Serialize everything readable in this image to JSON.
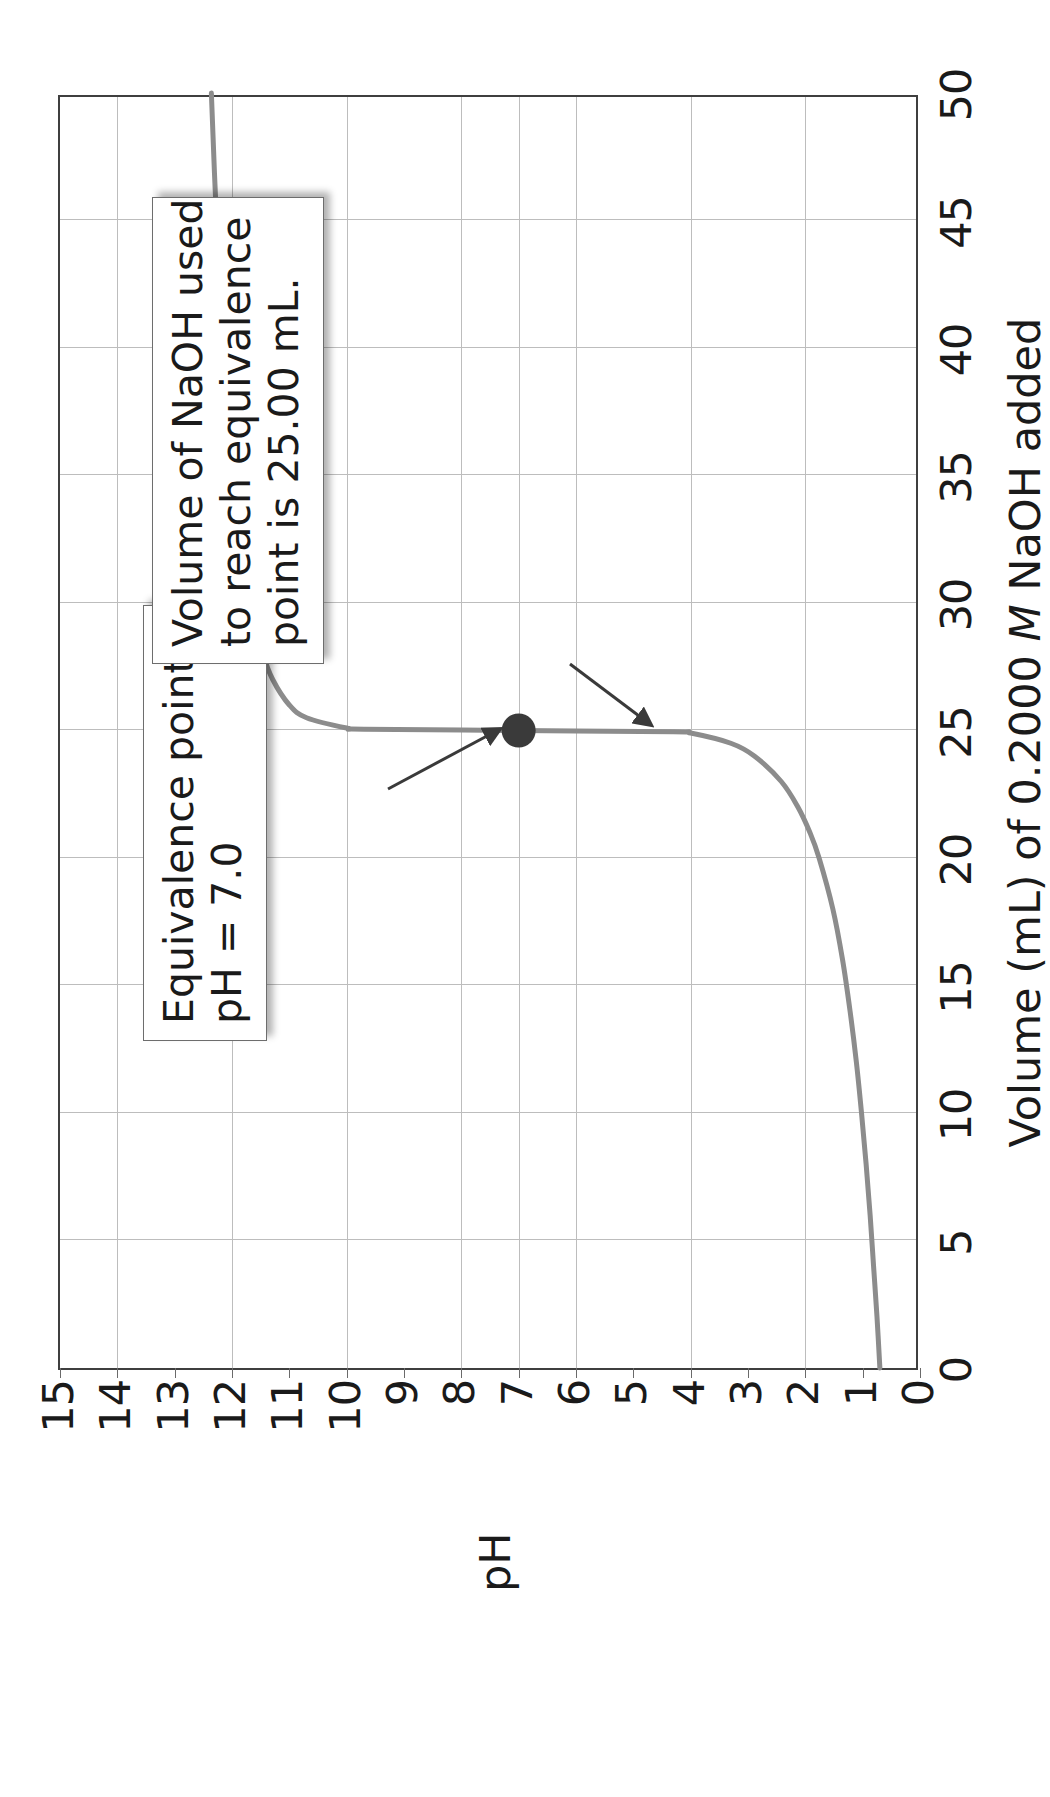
{
  "chart_data": {
    "type": "line",
    "title": "",
    "xlabel": "Volume (mL) of 0.2000 M NaOH added",
    "xlabel_parts": {
      "before": "Volume (mL) of 0.2000 ",
      "italic": "M",
      "after": " NaOH added"
    },
    "ylabel": "pH",
    "xlim": [
      0,
      50
    ],
    "ylim": [
      0,
      15
    ],
    "xticks": [
      "0",
      "5",
      "10",
      "15",
      "20",
      "25",
      "30",
      "35",
      "40",
      "45",
      "50"
    ],
    "xtick_values": [
      0,
      5,
      10,
      15,
      20,
      25,
      30,
      35,
      40,
      45,
      50
    ],
    "yticks": [
      "0",
      "1",
      "2",
      "3",
      "4",
      "5",
      "6",
      "7",
      "8",
      "9",
      "10",
      "11",
      "12",
      "13",
      "14",
      "15"
    ],
    "ytick_values": [
      0,
      1,
      2,
      3,
      4,
      5,
      6,
      7,
      8,
      9,
      10,
      11,
      12,
      13,
      14,
      15
    ],
    "grid": "major-x-and-y",
    "legend": "none",
    "series": [
      {
        "name": "Titration of strong acid with 0.2000 M NaOH",
        "color": "#8c8c8c",
        "x": [
          0.0,
          2.0,
          4.0,
          6.0,
          8.0,
          10.0,
          12.0,
          14.0,
          16.0,
          18.0,
          20.0,
          21.0,
          22.0,
          23.0,
          24.0,
          24.5,
          24.9,
          24.95,
          25.0,
          25.05,
          25.1,
          25.5,
          26.0,
          27.0,
          28.0,
          30.0,
          32.0,
          35.0,
          40.0,
          45.0,
          50.0
        ],
        "y": [
          0.7,
          0.75,
          0.81,
          0.87,
          0.94,
          1.02,
          1.11,
          1.22,
          1.35,
          1.52,
          1.76,
          1.92,
          2.13,
          2.42,
          2.89,
          3.3,
          4.0,
          4.3,
          7.0,
          9.7,
          10.0,
          10.7,
          11.0,
          11.29,
          11.46,
          11.68,
          11.82,
          11.97,
          12.15,
          12.27,
          12.36
        ]
      }
    ],
    "markers": [
      {
        "name": "equivalence-point",
        "x": 25.0,
        "y": 7.0,
        "color": "#3a3a3a",
        "shape": "circle"
      }
    ],
    "annotations": [
      {
        "id": "equivalence",
        "lines": [
          "Equivalence point,",
          "pH = 7.0"
        ],
        "points_to": {
          "x": 25.0,
          "y": 7.0
        }
      },
      {
        "id": "volume",
        "lines": [
          "Volume of NaOH used",
          "to reach equivalence",
          "point is 25.00 mL."
        ],
        "points_to": {
          "x": 25.0,
          "y": 0.0
        }
      }
    ]
  },
  "axes": {
    "x_title_before": "Volume (mL) of 0.2000 ",
    "x_title_italic": "M",
    "x_title_after": " NaOH added",
    "y_title": "pH"
  },
  "callouts": {
    "equivalence": {
      "line1": "Equivalence point,",
      "line2": "pH = 7.0"
    },
    "volume": {
      "line1": "Volume of NaOH used",
      "line2": "to reach equivalence",
      "line3": "point is 25.00 mL."
    }
  },
  "colors": {
    "curve": "#8c8c8c",
    "frame": "#3f3f3f",
    "grid": "#bdbdbd",
    "marker": "#3a3a3a",
    "text": "#1a1a1a",
    "background": "#ffffff"
  }
}
